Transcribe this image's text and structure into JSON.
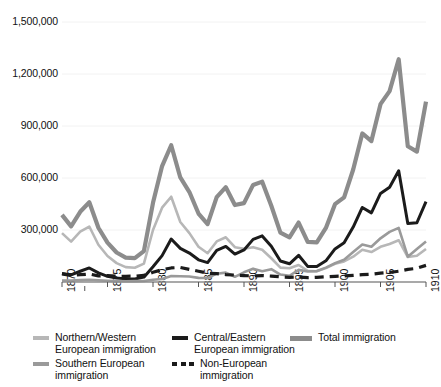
{
  "chart_data": {
    "type": "line",
    "title": "",
    "xlabel": "",
    "ylabel": "",
    "xlim": [
      1870,
      1910
    ],
    "ylim": [
      0,
      1500000
    ],
    "grid": "horizontal",
    "legend_position": "bottom",
    "y_ticks": [
      "1,500,000",
      "1,200,000",
      "900,000",
      "600,000",
      "300,000"
    ],
    "y_tick_values": [
      1500000,
      1200000,
      900000,
      600000,
      300000
    ],
    "x_ticks": [
      "1870",
      "1875",
      "1880",
      "1885",
      "1890",
      "1895",
      "1900",
      "1905",
      "1910"
    ],
    "x_tick_values": [
      1870,
      1875,
      1880,
      1885,
      1890,
      1895,
      1900,
      1905,
      1910
    ],
    "x": [
      1870,
      1871,
      1872,
      1873,
      1874,
      1875,
      1876,
      1877,
      1878,
      1879,
      1880,
      1881,
      1882,
      1883,
      1884,
      1885,
      1886,
      1887,
      1888,
      1889,
      1890,
      1891,
      1892,
      1893,
      1894,
      1895,
      1896,
      1897,
      1898,
      1899,
      1900,
      1901,
      1902,
      1903,
      1904,
      1905,
      1906,
      1907,
      1908,
      1909,
      1910
    ],
    "series": [
      {
        "name": "Total immigration",
        "color": "#8c8c8c",
        "width": 4.2,
        "dash": "none",
        "values": [
          387000,
          321000,
          405000,
          460000,
          313000,
          227000,
          170000,
          141000,
          138000,
          178000,
          457000,
          669000,
          789000,
          603000,
          519000,
          395000,
          334000,
          490000,
          547000,
          444000,
          455000,
          560000,
          579000,
          440000,
          285000,
          258000,
          343000,
          231000,
          229000,
          312000,
          449000,
          488000,
          649000,
          857000,
          813000,
          1026000,
          1101000,
          1285000,
          783000,
          752000,
          1041000
        ]
      },
      {
        "name": "Northern/Western European immigration",
        "color": "#b7b7b7",
        "width": 2.6,
        "dash": "none",
        "values": [
          282000,
          233000,
          290000,
          320000,
          215000,
          150000,
          109000,
          86000,
          82000,
          106000,
          300000,
          429000,
          492000,
          346000,
          282000,
          203000,
          166000,
          234000,
          258000,
          201000,
          192000,
          201000,
          186000,
          137000,
          83000,
          79000,
          98000,
          65000,
          62000,
          80000,
          105000,
          119000,
          146000,
          186000,
          173000,
          203000,
          219000,
          241000,
          144000,
          151000,
          190000
        ]
      },
      {
        "name": "Central/Eastern European immigration",
        "color": "#1b1b1b",
        "width": 3.0,
        "dash": "none",
        "values": [
          49000,
          41000,
          62000,
          81000,
          53000,
          33000,
          23000,
          18000,
          17000,
          28000,
          88000,
          152000,
          248000,
          194000,
          167000,
          128000,
          112000,
          183000,
          205000,
          161000,
          185000,
          246000,
          266000,
          206000,
          121000,
          105000,
          154000,
          90000,
          89000,
          122000,
          191000,
          226000,
          317000,
          430000,
          399000,
          511000,
          547000,
          642000,
          337000,
          342000,
          464000
        ]
      },
      {
        "name": "Southern European immigration",
        "color": "#9a9a9a",
        "width": 2.6,
        "dash": "none",
        "values": [
          9000,
          9000,
          11000,
          13000,
          10000,
          7000,
          5000,
          4000,
          5000,
          6000,
          13000,
          17000,
          34000,
          33000,
          32000,
          24000,
          23000,
          48000,
          54000,
          30000,
          56000,
          77000,
          62000,
          74000,
          43000,
          36000,
          70000,
          61000,
          63000,
          83000,
          108000,
          128000,
          173000,
          216000,
          203000,
          252000,
          289000,
          312000,
          146000,
          191000,
          234000
        ]
      },
      {
        "name": "Non-European immigration",
        "color": "#1b1b1b",
        "width": 3.2,
        "dash": "9 6",
        "values": [
          47000,
          38000,
          42000,
          46000,
          35000,
          37000,
          33000,
          33000,
          34000,
          38000,
          56000,
          71000,
          81000,
          84000,
          73000,
          62000,
          51000,
          48000,
          43000,
          40000,
          37000,
          35000,
          37000,
          34000,
          30000,
          27000,
          29000,
          25000,
          27000,
          30000,
          33000,
          35000,
          38000,
          42000,
          45000,
          51000,
          55000,
          62000,
          73000,
          79000,
          96000
        ]
      }
    ],
    "annotations": []
  },
  "legend": {
    "entries": [
      {
        "label": "Northern/Western\nEuropean immigration",
        "icon": "line-swatch-light-gray",
        "style": "solid",
        "color": "#b7b7b7",
        "col": 1,
        "row": 1
      },
      {
        "label": "Central/Eastern\nEuropean immigration",
        "icon": "line-swatch-black",
        "style": "solid",
        "color": "#1b1b1b",
        "col": 2,
        "row": 1
      },
      {
        "label": "Total immigration",
        "icon": "line-swatch-gray-thick",
        "style": "solid",
        "color": "#8c8c8c",
        "col": 3,
        "row": 1
      },
      {
        "label": "Southern European\nimmigration",
        "icon": "line-swatch-gray",
        "style": "solid",
        "color": "#9a9a9a",
        "col": 1,
        "row": 2
      },
      {
        "label": "Non-European\nimmigration",
        "icon": "line-swatch-dashed-black",
        "style": "dashed",
        "color": "#1b1b1b",
        "col": 2,
        "row": 2
      }
    ]
  },
  "axis_style": {
    "axis_color": "#8c8c8c",
    "gridline_color": "#f2f2f2",
    "tick_color": "#555555",
    "background": "#ffffff"
  }
}
